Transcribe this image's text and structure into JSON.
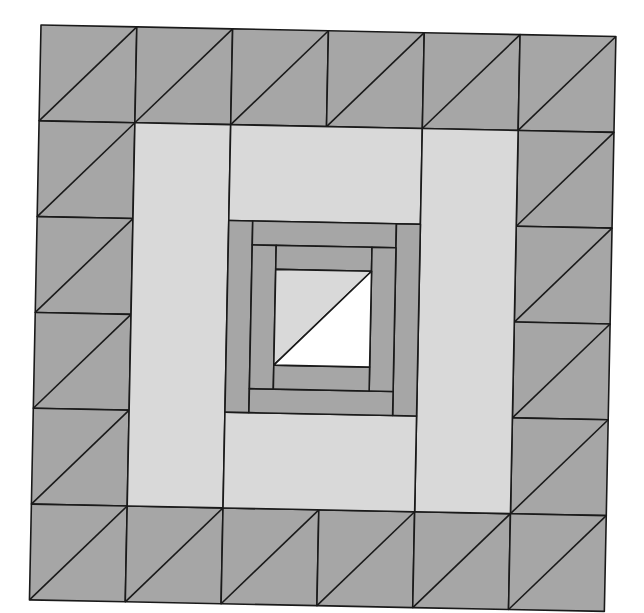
{
  "diagram": {
    "type": "quilt-block",
    "grid_size": 6,
    "rotation_deg": 1.15,
    "origin": [
      41,
      25
    ],
    "side_length": 575,
    "colors": {
      "dark": "#a6a6a6",
      "light": "#d9d9d9",
      "white": "#ffffff",
      "line": "#1a1a1a",
      "background": "#ffffff"
    },
    "border": {
      "cells_per_side": 6,
      "diagonal": "bottom-left to top-right",
      "fill": "dark"
    },
    "light_frame": {
      "pieces": [
        "left-column",
        "top-bar",
        "right-column",
        "bottom-bar"
      ],
      "fill": "light"
    },
    "center": {
      "frames": 2,
      "strip_width_ratio": 0.125,
      "fill": "dark",
      "core": {
        "upper_left_triangle": "light",
        "lower_right_triangle": "white"
      }
    }
  }
}
